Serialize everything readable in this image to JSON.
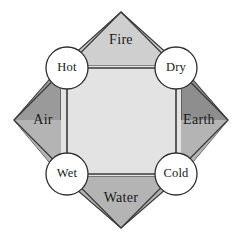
{
  "diagram": {
    "background_color": "#ffffff",
    "outline_color": "#3a3a3a",
    "center": {
      "x": 121,
      "y": 120
    },
    "diamond": {
      "top": {
        "x": 121,
        "y": 12
      },
      "right": {
        "x": 228,
        "y": 120
      },
      "bottom": {
        "x": 121,
        "y": 228
      },
      "left": {
        "x": 14,
        "y": 120
      }
    },
    "inner_square": {
      "left": 61,
      "top": 66,
      "right": 181,
      "bottom": 176,
      "fill_color": "#e3e3e3"
    },
    "elements": [
      {
        "id": "fire",
        "label": "Fire",
        "position": "top",
        "fill_color": "#cfcfcf",
        "label_x": 121,
        "label_y": 41
      },
      {
        "id": "air",
        "label": "Air",
        "position": "left",
        "fill_color": "#9a9a9a",
        "label_x": 43,
        "label_y": 121
      },
      {
        "id": "earth",
        "label": "Earth",
        "position": "right",
        "fill_color": "#8e8e8e",
        "label_x": 199,
        "label_y": 121
      },
      {
        "id": "water",
        "label": "Water",
        "position": "bottom",
        "fill_color": "#b4b4b4",
        "label_x": 121,
        "label_y": 199
      }
    ],
    "qualities": [
      {
        "id": "hot",
        "label": "Hot",
        "corner": "top-left",
        "cx": 67,
        "cy": 68,
        "r": 21,
        "fill_color": "#ffffff",
        "stroke_color": "#2e2e2e"
      },
      {
        "id": "dry",
        "label": "Dry",
        "corner": "top-right",
        "cx": 176,
        "cy": 68,
        "r": 21,
        "fill_color": "#ffffff",
        "stroke_color": "#2e2e2e"
      },
      {
        "id": "wet",
        "label": "Wet",
        "corner": "bottom-left",
        "cx": 67,
        "cy": 174,
        "r": 21,
        "fill_color": "#ffffff",
        "stroke_color": "#2e2e2e"
      },
      {
        "id": "cold",
        "label": "Cold",
        "corner": "bottom-right",
        "cx": 176,
        "cy": 174,
        "r": 21,
        "fill_color": "#ffffff",
        "stroke_color": "#2e2e2e"
      }
    ],
    "connectors": [
      {
        "id": "hot-dry",
        "from": "hot",
        "to": "dry",
        "x1": 88,
        "y1": 68,
        "x2": 155,
        "y2": 68
      },
      {
        "id": "dry-cold",
        "from": "dry",
        "to": "cold",
        "x1": 176,
        "y1": 89,
        "x2": 176,
        "y2": 153
      },
      {
        "id": "cold-wet",
        "from": "cold",
        "to": "wet",
        "x1": 155,
        "y1": 174,
        "x2": 88,
        "y2": 174
      },
      {
        "id": "wet-hot",
        "from": "wet",
        "to": "hot",
        "x1": 67,
        "y1": 153,
        "x2": 67,
        "y2": 89
      }
    ]
  }
}
